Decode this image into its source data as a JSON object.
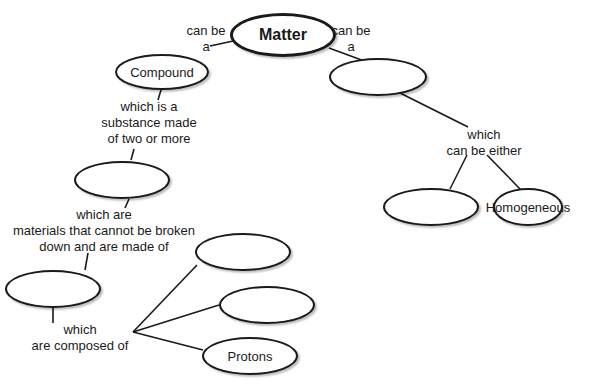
{
  "diagram": {
    "type": "concept-map",
    "nodes": [
      {
        "id": "matter",
        "text": "Matter",
        "cx": 283,
        "cy": 35,
        "rx": 53,
        "ry": 22,
        "thick": true
      },
      {
        "id": "compound",
        "text": "Compound",
        "cx": 162,
        "cy": 72,
        "rx": 47,
        "ry": 18
      },
      {
        "id": "mixture",
        "text": "",
        "cx": 378,
        "cy": 77,
        "rx": 49,
        "ry": 19
      },
      {
        "id": "element",
        "text": "",
        "cx": 122,
        "cy": 180,
        "rx": 48,
        "ry": 19
      },
      {
        "id": "heterogeneous",
        "text": "",
        "cx": 431,
        "cy": 207,
        "rx": 48,
        "ry": 19
      },
      {
        "id": "homogeneous",
        "text": "Homogeneous",
        "cx": 528,
        "cy": 207,
        "rx": 35,
        "ry": 19
      },
      {
        "id": "atom",
        "text": "",
        "cx": 53,
        "cy": 289,
        "rx": 48,
        "ry": 19
      },
      {
        "id": "particle-1",
        "text": "",
        "cx": 243,
        "cy": 252,
        "rx": 48,
        "ry": 19
      },
      {
        "id": "particle-2",
        "text": "",
        "cx": 267,
        "cy": 305,
        "rx": 48,
        "ry": 19
      },
      {
        "id": "protons",
        "text": "Protons",
        "cx": 250,
        "cy": 356,
        "rx": 48,
        "ry": 19
      }
    ],
    "labels": [
      {
        "id": "can-be-left",
        "lines": [
          "can be",
          "a"
        ],
        "x": 206,
        "y": 23
      },
      {
        "id": "can-be-right",
        "lines": [
          "can be",
          "a"
        ],
        "x": 351,
        "y": 23
      },
      {
        "id": "which-is-a",
        "lines": [
          "which is a",
          "substance made",
          "of two or more"
        ],
        "x": 149,
        "y": 99
      },
      {
        "id": "which-are",
        "lines": [
          "which are",
          "materials that cannot be broken",
          "down and are made of"
        ],
        "x": 104,
        "y": 207
      },
      {
        "id": "which-composed",
        "lines": [
          "which",
          "are composed of"
        ],
        "x": 80,
        "y": 322
      },
      {
        "id": "which-either",
        "lines": [
          "which",
          "can be either"
        ],
        "x": 484,
        "y": 127
      }
    ],
    "edges": [
      [
        210,
        46,
        238,
        40
      ],
      [
        329,
        48,
        367,
        62
      ],
      [
        161,
        90,
        158,
        100
      ],
      [
        400,
        93,
        468,
        127
      ],
      [
        134,
        149,
        131,
        160
      ],
      [
        129,
        199,
        125,
        208
      ],
      [
        467,
        155,
        450,
        189
      ],
      [
        487,
        155,
        520,
        189
      ],
      [
        88,
        253,
        85,
        270
      ],
      [
        53,
        308,
        53,
        323
      ],
      [
        133,
        332,
        197,
        265
      ],
      [
        133,
        332,
        219,
        305
      ],
      [
        133,
        332,
        203,
        350
      ]
    ]
  }
}
